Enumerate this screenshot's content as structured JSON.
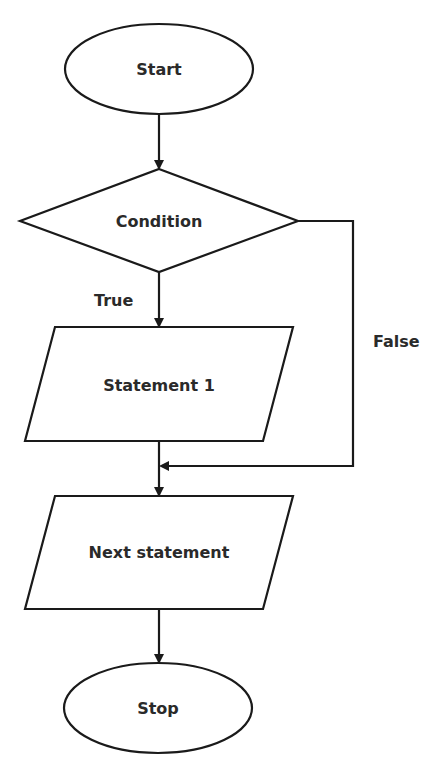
{
  "diagram": {
    "type": "flowchart",
    "nodes": [
      {
        "id": "start",
        "shape": "ellipse",
        "label": "Start"
      },
      {
        "id": "condition",
        "shape": "diamond",
        "label": "Condition"
      },
      {
        "id": "statement1",
        "shape": "parallelogram",
        "label": "Statement 1"
      },
      {
        "id": "next",
        "shape": "parallelogram",
        "label": "Next statement"
      },
      {
        "id": "stop",
        "shape": "ellipse",
        "label": "Stop"
      }
    ],
    "edges": [
      {
        "from": "start",
        "to": "condition",
        "label": ""
      },
      {
        "from": "condition",
        "to": "statement1",
        "label": "True"
      },
      {
        "from": "condition",
        "to": "next",
        "label": "False"
      },
      {
        "from": "statement1",
        "to": "next",
        "label": ""
      },
      {
        "from": "next",
        "to": "stop",
        "label": ""
      }
    ],
    "labels": {
      "start": "Start",
      "condition": "Condition",
      "statement1": "Statement 1",
      "next": "Next statement",
      "stop": "Stop",
      "true_edge": "True",
      "false_edge": "False"
    },
    "colors": {
      "stroke": "#1a1a1a",
      "fill": "#ffffff",
      "text": "#2a2a2a"
    }
  }
}
